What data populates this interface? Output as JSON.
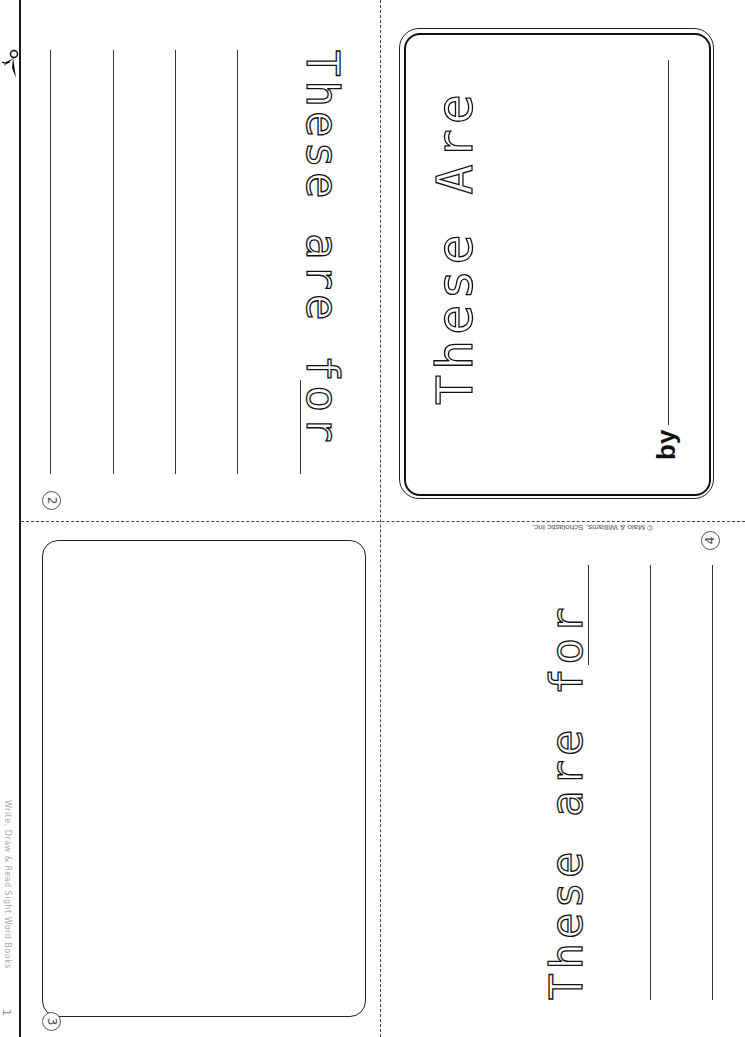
{
  "sheet": {
    "margin_label": "Write, Draw & Read Sight Word Books",
    "margin_page_number": "1",
    "copyright": "© Maio & Williams, Scholastic Inc."
  },
  "pages": {
    "cover": {
      "title_trace": "These Are",
      "byline_label": "by"
    },
    "page2": {
      "number": "2",
      "sentence_trace": "These are for",
      "writing_lines": 4
    },
    "page3": {
      "number": "3",
      "drawing_box": "blank"
    },
    "page4": {
      "number": "4",
      "sentence_trace": "These are for",
      "writing_lines": 2
    }
  },
  "icons": {
    "scissors": "scissors-icon"
  },
  "colors": {
    "ink": "#111111",
    "paper": "#ffffff",
    "faint": "#aaaaaa"
  }
}
